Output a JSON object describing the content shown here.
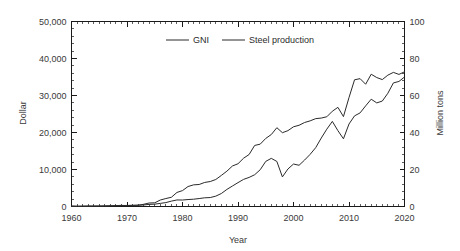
{
  "chart_data": {
    "type": "line",
    "title": "",
    "xlabel": "Year",
    "ylabel": "Dollar",
    "y2label": "Million tons",
    "xlim": [
      1960,
      2020
    ],
    "ylim": [
      0,
      50000
    ],
    "y2lim": [
      0,
      100
    ],
    "grid": false,
    "legend_position": "top-center",
    "x_ticks": [
      "1960",
      "1970",
      "1980",
      "1990",
      "2000",
      "2010",
      "2020"
    ],
    "x_tick_values": [
      1960,
      1970,
      1980,
      1990,
      2000,
      2010,
      2020
    ],
    "x_minor_interval": 1,
    "y_ticks": [
      "0",
      "10,000",
      "20,000",
      "30,000",
      "40,000",
      "50,000"
    ],
    "y_tick_values": [
      0,
      10000,
      20000,
      30000,
      40000,
      50000
    ],
    "y_minor_interval": 2000,
    "y2_ticks": [
      "0",
      "20",
      "40",
      "60",
      "80",
      "100"
    ],
    "y2_tick_values": [
      0,
      20,
      40,
      60,
      80,
      100
    ],
    "y2_minor_interval": 4,
    "x": [
      1960,
      1961,
      1962,
      1963,
      1964,
      1965,
      1966,
      1967,
      1968,
      1969,
      1970,
      1971,
      1972,
      1973,
      1974,
      1975,
      1976,
      1977,
      1978,
      1979,
      1980,
      1981,
      1982,
      1983,
      1984,
      1985,
      1986,
      1987,
      1988,
      1989,
      1990,
      1991,
      1992,
      1993,
      1994,
      1995,
      1996,
      1997,
      1998,
      1999,
      2000,
      2001,
      2002,
      2003,
      2004,
      2005,
      2006,
      2007,
      2008,
      2009,
      2010,
      2011,
      2012,
      2013,
      2014,
      2015,
      2016,
      2017,
      2018,
      2019,
      2020
    ],
    "series": [
      {
        "name": "GNI",
        "axis": "left",
        "unit": "Dollar",
        "color": "#2a2a2a",
        "values": [
          160,
          95,
          110,
          145,
          125,
          115,
          135,
          160,
          200,
          250,
          290,
          310,
          340,
          410,
          570,
          630,
          840,
          1060,
          1450,
          1770,
          1750,
          1880,
          1970,
          2150,
          2350,
          2420,
          2800,
          3510,
          4620,
          5540,
          6450,
          7330,
          7860,
          8580,
          9930,
          12200,
          13010,
          12180,
          8000,
          10140,
          11480,
          11140,
          12550,
          14100,
          15900,
          18500,
          20900,
          23000,
          20500,
          18300,
          22300,
          24500,
          25300,
          27200,
          29000,
          28000,
          28500,
          30600,
          33400,
          33800,
          35000
        ]
      },
      {
        "name": "Steel production",
        "axis": "right",
        "unit": "Million tons",
        "color": "#2a2a2a",
        "values": [
          0.05,
          0.06,
          0.1,
          0.12,
          0.2,
          0.25,
          0.3,
          0.4,
          0.5,
          0.6,
          0.5,
          0.6,
          0.7,
          1.2,
          1.9,
          2.0,
          3.5,
          4.3,
          5.0,
          7.6,
          8.6,
          10.8,
          11.7,
          11.9,
          13.0,
          13.5,
          14.6,
          16.8,
          19.1,
          21.9,
          23.1,
          26.1,
          28.1,
          33.0,
          33.7,
          36.8,
          38.9,
          42.6,
          39.9,
          41.0,
          43.1,
          43.9,
          45.4,
          46.3,
          47.5,
          47.8,
          48.5,
          51.5,
          53.6,
          48.6,
          58.9,
          68.5,
          69.1,
          66.1,
          71.5,
          69.7,
          68.6,
          71.0,
          72.5,
          71.4,
          72.8
        ]
      }
    ]
  },
  "legend": {
    "entries": [
      {
        "label": "GNI"
      },
      {
        "label": "Steel production"
      }
    ]
  },
  "axes": {
    "x_title": "Year",
    "y_left_title": "Dollar",
    "y_right_title": "Million tons"
  }
}
